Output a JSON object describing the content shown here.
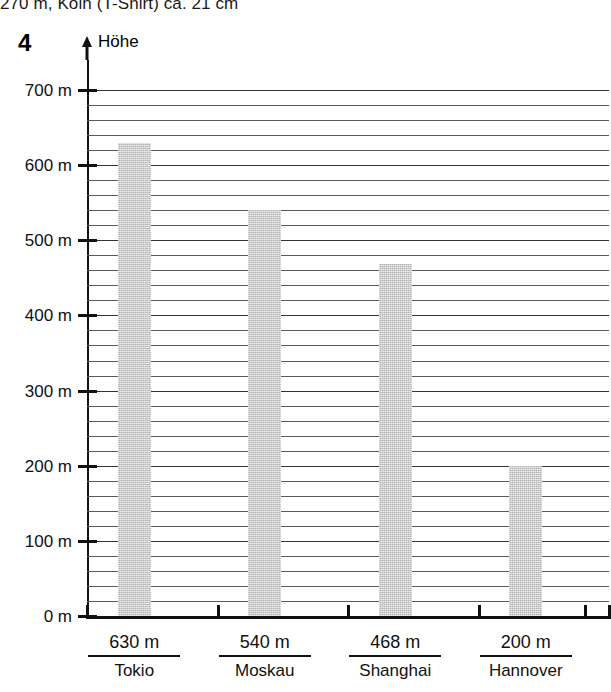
{
  "page": {
    "header_text": "270 m, Köln (T-Shirt) ca. 21 cm",
    "exercise_number": "4"
  },
  "axes": {
    "y_label": "Höhe",
    "y_arrow_icon": "up-arrow-icon",
    "y_ticks": [
      "700 m",
      "600 m",
      "500 m",
      "400 m",
      "300 m",
      "200 m",
      "100 m",
      "0 m"
    ]
  },
  "chart_data": {
    "type": "bar",
    "title": "Höhe",
    "xlabel": "",
    "ylabel": "Höhe",
    "categories": [
      "Tokio",
      "Moskau",
      "Shanghai",
      "Hannover"
    ],
    "values": [
      630,
      540,
      468,
      200
    ],
    "value_labels": [
      "630 m",
      "540 m",
      "468 m",
      "200 m"
    ],
    "unit": "m",
    "ylim": [
      0,
      720
    ],
    "y_major_tick_step": 100,
    "y_minor_gridline_step": 20,
    "grid": true,
    "legend": false,
    "bar_color": "#c9c9c9",
    "axis_color": "#111111",
    "gridline_color": "#5a5a5a"
  }
}
